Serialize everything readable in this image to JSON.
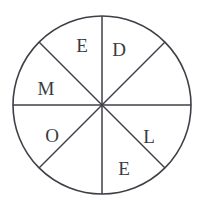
{
  "figure": {
    "name": "letter-wheel",
    "background_color": "#ffffff",
    "stroke_color": "#3f3f47",
    "text_color": "#3a3a42",
    "canvas": {
      "width": 204,
      "height": 212
    },
    "circle": {
      "cx": 102,
      "cy": 105,
      "r": 89
    },
    "sector_count": 8,
    "spoke_angles_deg": [
      0,
      45,
      90,
      135,
      180,
      225,
      270,
      315
    ],
    "letters_in_order": "MEDLEO"
  },
  "sectors": [
    {
      "id": "sector-n-ne",
      "position": "top-right-of-vertical",
      "angle_range_deg": [
        45,
        90
      ],
      "label": "D",
      "label_x": 119,
      "label_y": 56
    },
    {
      "id": "sector-ne-e",
      "position": "upper-right-outer",
      "angle_range_deg": [
        0,
        45
      ],
      "label": "",
      "label_x": 146,
      "label_y": 70
    },
    {
      "id": "sector-e-se",
      "position": "lower-right",
      "angle_range_deg": [
        315,
        360
      ],
      "label": "L",
      "label_x": 149,
      "label_y": 143
    },
    {
      "id": "sector-se-s",
      "position": "bottom-right-of-vertical",
      "angle_range_deg": [
        270,
        315
      ],
      "label": "E",
      "label_x": 124,
      "label_y": 175
    },
    {
      "id": "sector-s-sw",
      "position": "bottom-left-of-vertical",
      "angle_range_deg": [
        225,
        270
      ],
      "label": "",
      "label_x": 78,
      "label_y": 175
    },
    {
      "id": "sector-sw-w",
      "position": "lower-left",
      "angle_range_deg": [
        180,
        225
      ],
      "label": "O",
      "label_x": 52,
      "label_y": 142
    },
    {
      "id": "sector-w-nw",
      "position": "upper-left",
      "angle_range_deg": [
        135,
        180
      ],
      "label": "M",
      "label_x": 46,
      "label_y": 95
    },
    {
      "id": "sector-nw-n",
      "position": "top-left-of-vertical",
      "angle_range_deg": [
        90,
        135
      ],
      "label": "E",
      "label_x": 82,
      "label_y": 52
    }
  ]
}
